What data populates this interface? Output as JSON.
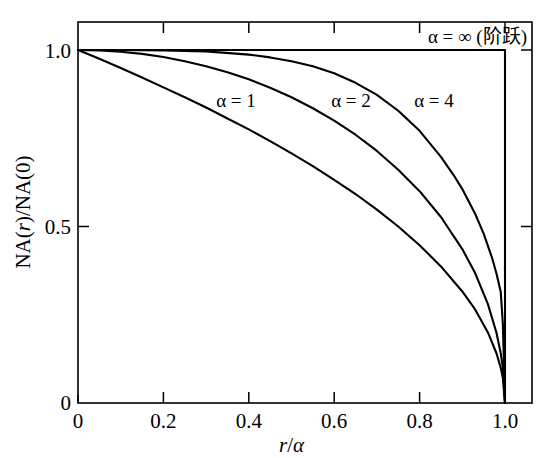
{
  "figure": {
    "background_color": "#ffffff",
    "line_color": "#000000"
  },
  "chart_data": {
    "type": "line",
    "title": "",
    "subtitle": "",
    "xlabel": "r/α",
    "ylabel": "NA(r)/NA(0)",
    "xlim": [
      0,
      1.06
    ],
    "ylim": [
      0,
      1.08
    ],
    "xticks": [
      0,
      0.2,
      0.4,
      0.6,
      0.8,
      1.0
    ],
    "xtick_labels": [
      "0",
      "0.2",
      "0.4",
      "0.6",
      "0.8",
      "1.0"
    ],
    "yticks": [
      0,
      0.5,
      1.0
    ],
    "ytick_labels": [
      "0",
      "0.5",
      "1.0"
    ],
    "grid": false,
    "legend_position": "inline-annotations",
    "equation": "NA(r)/NA(0) = sqrt(1 - (r/a)^alpha)",
    "series": [
      {
        "name": "α = 1",
        "alpha": 1,
        "label": "α = 1",
        "label_x": 0.37,
        "label_y": 0.8,
        "x": [
          0.0,
          0.02,
          0.05,
          0.1,
          0.15,
          0.2,
          0.25,
          0.3,
          0.35,
          0.4,
          0.45,
          0.5,
          0.55,
          0.6,
          0.65,
          0.7,
          0.75,
          0.8,
          0.85,
          0.9,
          0.93,
          0.96,
          0.98,
          0.99,
          0.995,
          1.0
        ],
        "values": [
          1.0,
          0.99,
          0.975,
          0.949,
          0.922,
          0.894,
          0.866,
          0.837,
          0.806,
          0.775,
          0.742,
          0.707,
          0.671,
          0.632,
          0.592,
          0.548,
          0.5,
          0.447,
          0.387,
          0.316,
          0.265,
          0.2,
          0.141,
          0.1,
          0.071,
          0.0
        ]
      },
      {
        "name": "α = 2",
        "alpha": 2,
        "label": "α = 2",
        "label_x": 0.645,
        "label_y": 0.8,
        "x": [
          0.0,
          0.05,
          0.1,
          0.15,
          0.2,
          0.25,
          0.3,
          0.35,
          0.4,
          0.45,
          0.5,
          0.55,
          0.6,
          0.65,
          0.7,
          0.75,
          0.8,
          0.85,
          0.9,
          0.93,
          0.96,
          0.98,
          0.99,
          0.995,
          1.0
        ],
        "values": [
          1.0,
          0.999,
          0.995,
          0.989,
          0.98,
          0.968,
          0.954,
          0.937,
          0.917,
          0.893,
          0.866,
          0.835,
          0.8,
          0.76,
          0.714,
          0.661,
          0.6,
          0.527,
          0.436,
          0.368,
          0.28,
          0.199,
          0.141,
          0.0999,
          0.0
        ]
      },
      {
        "name": "α = 4",
        "alpha": 4,
        "label": "α = 4",
        "label_x": 0.835,
        "label_y": 0.8,
        "x": [
          0.0,
          0.1,
          0.2,
          0.3,
          0.4,
          0.45,
          0.5,
          0.55,
          0.6,
          0.65,
          0.7,
          0.75,
          0.8,
          0.85,
          0.88,
          0.9,
          0.93,
          0.95,
          0.97,
          0.98,
          0.99,
          0.995,
          1.0
        ],
        "values": [
          1.0,
          1.0,
          0.999,
          0.996,
          0.987,
          0.979,
          0.968,
          0.954,
          0.934,
          0.907,
          0.873,
          0.828,
          0.771,
          0.697,
          0.645,
          0.606,
          0.536,
          0.48,
          0.41,
          0.367,
          0.315,
          0.2234,
          0.0
        ]
      },
      {
        "name": "α = ∞ (阶跃)",
        "alpha": "∞",
        "label": "α = ∞ (阶跃)",
        "label_x": 0.86,
        "label_y": 1.055,
        "x": [
          0.0,
          0.999,
          1.0
        ],
        "values": [
          1.0,
          1.0,
          0.0
        ]
      }
    ]
  },
  "axes": {
    "x_axis_title": "r/α",
    "x_axis_title_parts": {
      "numerator": "r",
      "slash": "/",
      "denominator": "α"
    },
    "y_axis_title": "NA(r)/NA(0)",
    "y_axis_title_parts": {
      "prefix": "NA(",
      "variable": "r",
      "middle": ")/NA(0)"
    },
    "x_tick_labels": [
      "0",
      "0.2",
      "0.4",
      "0.6",
      "0.8",
      "1.0"
    ],
    "y_tick_labels": [
      "0",
      "0.5",
      "1.0"
    ]
  },
  "annotations": {
    "alpha1": "α = 1",
    "alpha2": "α = 2",
    "alpha4": "α = 4",
    "alpha_inf": "α = ∞ (阶跃)"
  }
}
